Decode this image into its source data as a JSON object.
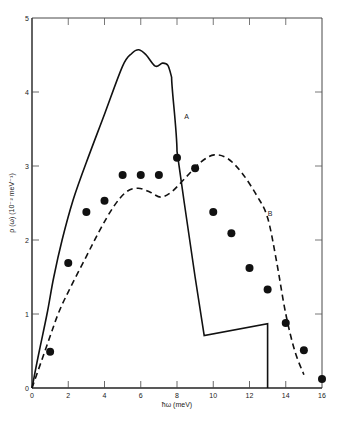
{
  "chart_data": {
    "type": "line",
    "title": "",
    "xlabel": "ħω (meV)",
    "ylabel": "ρ (ω) (10⁻² meV⁻¹)",
    "xlim": [
      0,
      16
    ],
    "ylim": [
      0,
      5
    ],
    "x_ticks": [
      0,
      2,
      4,
      6,
      8,
      10,
      12,
      14,
      16
    ],
    "x_tick_labels": [
      "0",
      "2",
      "4",
      "6",
      "8",
      "10",
      "12",
      "14",
      "16"
    ],
    "y_ticks": [
      0,
      1,
      2,
      3,
      4,
      5
    ],
    "y_tick_labels": [
      "0",
      "1",
      "2",
      "3",
      "4",
      "5"
    ],
    "grid": false,
    "legend": "none (curves labeled inline)",
    "series": [
      {
        "name": "A",
        "style": "solid line",
        "x": [
          0,
          0.4,
          0.83,
          1.2,
          1.66,
          2.27,
          3.0,
          4.0,
          5.0,
          5.5,
          5.9,
          6.3,
          6.8,
          7.2,
          7.5,
          7.7,
          8.0,
          8.4,
          9.0,
          9.5,
          13.0,
          13.0
        ],
        "y": [
          0,
          0.5,
          1.0,
          1.5,
          2.0,
          2.54,
          3.05,
          3.7,
          4.35,
          4.52,
          4.57,
          4.5,
          4.35,
          4.39,
          4.36,
          4.2,
          3.2,
          2.5,
          1.5,
          0.71,
          0.87,
          0
        ]
      },
      {
        "name": "B",
        "style": "dashed line",
        "x": [
          0,
          0.5,
          1.0,
          1.44,
          2.0,
          3.0,
          3.76,
          4.5,
          5.2,
          5.86,
          6.5,
          7.1,
          7.7,
          8.5,
          9.3,
          10.05,
          10.8,
          11.6,
          12.4,
          13.0,
          13.5,
          14.0,
          14.5,
          15.0
        ],
        "y": [
          0,
          0.35,
          0.7,
          1.0,
          1.3,
          1.78,
          2.14,
          2.45,
          2.65,
          2.7,
          2.65,
          2.58,
          2.65,
          2.85,
          3.05,
          3.15,
          3.1,
          2.9,
          2.6,
          2.3,
          1.7,
          1.0,
          0.5,
          0.18
        ]
      },
      {
        "name": "experimental points",
        "style": "filled circles",
        "x": [
          1,
          2,
          3,
          4,
          5,
          6,
          7,
          8,
          9,
          10,
          11,
          12,
          13,
          14,
          15,
          16
        ],
        "y": [
          0.49,
          1.69,
          2.38,
          2.53,
          2.88,
          2.88,
          2.88,
          3.11,
          2.97,
          2.38,
          2.09,
          1.62,
          1.33,
          0.88,
          0.51,
          0.12
        ]
      }
    ],
    "annotations": [
      {
        "text": "A",
        "x": 8.4,
        "y": 3.68
      },
      {
        "text": "B",
        "x": 13.0,
        "y": 2.36
      }
    ]
  },
  "labels": {
    "xlabel": "ħω (meV)",
    "ylabel": "ρ (ω) (10⁻² meV⁻¹)",
    "curve_a": "A",
    "curve_b": "B"
  },
  "style": {
    "line_color": "#111111",
    "point_color": "#111111",
    "frame_color": "#333333",
    "background": "#ffffff"
  }
}
